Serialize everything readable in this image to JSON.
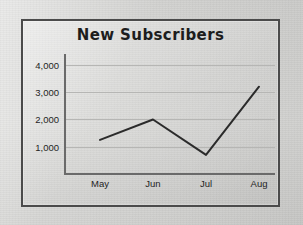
{
  "frame": {
    "border_color": "#4b4b4b",
    "background_color": "#d8d8d6"
  },
  "chart_data": {
    "type": "line",
    "title": "New Subscribers",
    "xlabel": "",
    "ylabel": "",
    "categories": [
      "May",
      "Jun",
      "Jul",
      "Aug"
    ],
    "values": [
      1250,
      2000,
      700,
      3200
    ],
    "series": [
      {
        "name": "New Subscribers",
        "values": [
          1250,
          2000,
          700,
          3200
        ]
      }
    ],
    "ylim": [
      0,
      4400
    ],
    "y_ticks": [
      1000,
      2000,
      3000,
      4000
    ],
    "y_tick_labels": [
      "1,000",
      "2,000",
      "3,000",
      "4,000"
    ],
    "x_tick_labels": [
      "May",
      "Jun",
      "Jul",
      "Aug"
    ],
    "grid": true,
    "grid_axis": "y",
    "legend": false,
    "legend_position": "none",
    "line_color": "#2b2b2b",
    "line_width": 2,
    "markers": false
  }
}
